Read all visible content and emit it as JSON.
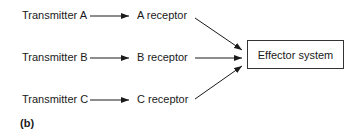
{
  "diagram": {
    "transmitters": [
      {
        "label": "Transmitter A"
      },
      {
        "label": "Transmitter B"
      },
      {
        "label": "Transmitter C"
      }
    ],
    "receptors": [
      {
        "label": "A receptor"
      },
      {
        "label": "B receptor"
      },
      {
        "label": "C receptor"
      }
    ],
    "effector": {
      "label": "Effector system"
    },
    "panel_label": "(b)"
  }
}
